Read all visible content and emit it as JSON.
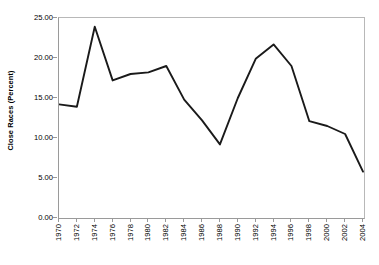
{
  "chart_data": {
    "type": "line",
    "title": "",
    "xlabel": "",
    "ylabel": "Close Races (Percent)",
    "ylim": [
      0,
      25
    ],
    "ytick_labels": [
      "0.00",
      "5.00",
      "10.00",
      "15.00",
      "20.00",
      "25.00"
    ],
    "ytick_values": [
      0,
      5,
      10,
      15,
      20,
      25
    ],
    "grid": false,
    "legend": false,
    "legend_position": "none",
    "categories": [
      "1970",
      "1972",
      "1974",
      "1976",
      "1978",
      "1980",
      "1982",
      "1984",
      "1986",
      "1988",
      "1990",
      "1992",
      "1994",
      "1996",
      "1998",
      "2000",
      "2002",
      "2004"
    ],
    "x": [
      1970,
      1972,
      1974,
      1976,
      1978,
      1980,
      1982,
      1984,
      1986,
      1988,
      1990,
      1992,
      1994,
      1996,
      1998,
      2000,
      2002,
      2004
    ],
    "values": [
      14.2,
      13.9,
      23.9,
      17.2,
      18.0,
      18.2,
      19.0,
      14.8,
      12.2,
      9.2,
      15.0,
      19.9,
      21.7,
      19.0,
      12.1,
      11.5,
      10.5,
      5.8
    ],
    "series": [
      {
        "name": "Close Races (Percent)",
        "color": "#1a1a1a",
        "values": [
          14.2,
          13.9,
          23.9,
          17.2,
          18.0,
          18.2,
          19.0,
          14.8,
          12.2,
          9.2,
          15.0,
          19.9,
          21.7,
          19.0,
          12.1,
          11.5,
          10.5,
          5.8
        ]
      }
    ]
  },
  "style": {
    "line_color": "#1a1a1a",
    "axis_color": "#9a9a9a",
    "frame_color": "#b8b8b8",
    "background": "#ffffff",
    "text_color": "#000000"
  }
}
